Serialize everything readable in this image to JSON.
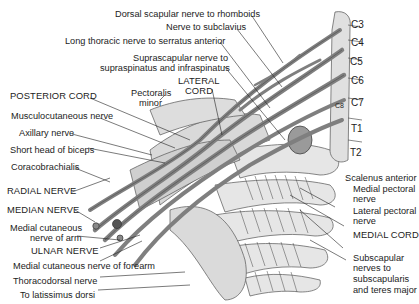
{
  "figure": {
    "labels_top": [
      {
        "id": "dorsal-scapular",
        "text": "Dorsal scapular nerve to rhomboids"
      },
      {
        "id": "nerve-subclavius",
        "text": "Nerve to subclavius"
      },
      {
        "id": "long-thoracic",
        "text": "Long thoracic nerve to serratus anterior"
      },
      {
        "id": "suprascapular-1",
        "text": "Suprascapular nerve to"
      },
      {
        "id": "suprascapular-2",
        "text": "supraspinatus and infraspinatus"
      },
      {
        "id": "lateral-cord-1",
        "text": "LATERAL"
      },
      {
        "id": "lateral-cord-2",
        "text": "CORD"
      },
      {
        "id": "pectoralis-minor-1",
        "text": "Pectoralis"
      },
      {
        "id": "pectoralis-minor-2",
        "text": "minor"
      }
    ],
    "labels_left": [
      {
        "id": "posterior-cord",
        "text": "POSTERIOR CORD"
      },
      {
        "id": "musculocutaneous",
        "text": "Musculocutaneous nerve"
      },
      {
        "id": "axillary",
        "text": "Axillary nerve"
      },
      {
        "id": "short-head-biceps",
        "text": "Short head of biceps"
      },
      {
        "id": "coracobrachialis",
        "text": "Coracobrachialis"
      },
      {
        "id": "radial",
        "text": "RADIAL NERVE"
      },
      {
        "id": "median",
        "text": "MEDIAN NERVE"
      },
      {
        "id": "medial-cut-arm-1",
        "text": "Medial cutaneous"
      },
      {
        "id": "medial-cut-arm-2",
        "text": "nerve of arm"
      },
      {
        "id": "ulnar",
        "text": "ULNAR NERVE"
      },
      {
        "id": "medial-cut-forearm",
        "text": "Medial cutaneous nerve of forearm"
      },
      {
        "id": "thoracodorsal",
        "text": "Thoracodorsal nerve"
      },
      {
        "id": "latissimus",
        "text": "To latissimus dorsi"
      }
    ],
    "labels_right": [
      {
        "id": "scalenus",
        "text": "Scalenus anterior"
      },
      {
        "id": "medial-pectoral-1",
        "text": "Medial pectoral"
      },
      {
        "id": "medial-pectoral-2",
        "text": "nerve"
      },
      {
        "id": "lateral-pectoral-1",
        "text": "Lateral pectoral"
      },
      {
        "id": "lateral-pectoral-2",
        "text": "nerve"
      },
      {
        "id": "medial-cord",
        "text": "MEDIAL CORD"
      },
      {
        "id": "subscapular-1",
        "text": "Subscapular"
      },
      {
        "id": "subscapular-2",
        "text": "nerves to"
      },
      {
        "id": "subscapular-3",
        "text": "subscapularis"
      },
      {
        "id": "subscapular-4",
        "text": "and teres major"
      }
    ],
    "spine_levels": [
      "C3",
      "C4",
      "C5",
      "C6",
      "C7",
      "C8",
      "T1",
      "T2"
    ]
  }
}
